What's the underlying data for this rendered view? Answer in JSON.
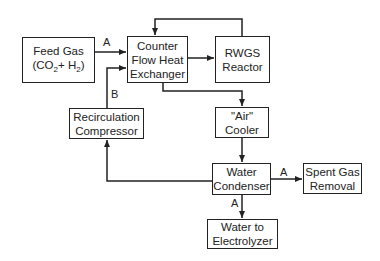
{
  "diagram": {
    "nodes": {
      "feed_gas": {
        "line1": "Feed Gas",
        "line2_prefix": "(CO",
        "line2_sub1": "2",
        "line2_mid": "+ H",
        "line2_sub2": "2",
        "line2_suffix": ")"
      },
      "heat_exchanger": {
        "line1": "Counter",
        "line2": "Flow Heat",
        "line3": "Exchanger"
      },
      "rwgs_reactor": {
        "line1": "RWGS",
        "line2": "Reactor"
      },
      "recirc_compressor": {
        "line1": "Recirculation",
        "line2": "Compressor"
      },
      "air_cooler": {
        "line1": "\"Air\"",
        "line2": "Cooler"
      },
      "water_condenser": {
        "line1": "Water",
        "line2": "Condenser"
      },
      "spent_gas": {
        "line1": "Spent Gas",
        "line2": "Removal"
      },
      "water_electrolyzer": {
        "line1": "Water to",
        "line2": "Electrolyzer"
      }
    },
    "edge_labels": {
      "feed_to_hx": "A",
      "recirc_to_hx": "B",
      "condenser_to_spent": "A",
      "condenser_to_water": "A"
    },
    "colors": {
      "line": "#222222",
      "background": "#ffffff"
    }
  }
}
